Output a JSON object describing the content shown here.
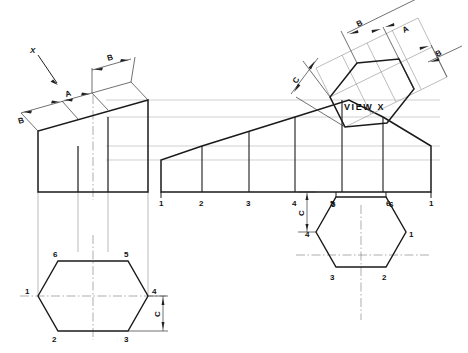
{
  "drawing": {
    "title": "Hexagonal prism — orthographic projection with auxiliary view",
    "view_label": "VIEW X",
    "direction_label": "X",
    "dimension_labels": {
      "a": "A",
      "b": "B",
      "c": "C"
    },
    "colors": {
      "object_line": "#1a1a1a",
      "thin_line": "#555555",
      "projection_line": "#b9b9b9",
      "center_line": "#8a8a8a",
      "background": "#ffffff"
    }
  },
  "left_view": {
    "name": "side-elevation-wedge",
    "top_dimensions": [
      {
        "label": "B",
        "position": "lower-left"
      },
      {
        "label": "A",
        "position": "middle"
      },
      {
        "label": "B",
        "position": "upper-right"
      }
    ],
    "direction_arrow": {
      "label": "X"
    }
  },
  "left_plan": {
    "name": "hexagon-plan-left",
    "vertex_labels": {
      "top_left": "6",
      "top_right": "5",
      "left": "1",
      "right": "4",
      "bottom_left": "2",
      "bottom_right": "3"
    },
    "dimension": {
      "label": "C"
    }
  },
  "front_view": {
    "name": "front-elevation",
    "baseline_labels": [
      "1",
      "2",
      "3",
      "4",
      "5",
      "6",
      "1"
    ],
    "dimension": {
      "label": "C"
    }
  },
  "right_plan": {
    "name": "hexagon-plan-right",
    "vertex_labels": {
      "top_left": "5",
      "top_right": "6",
      "left": "4",
      "right": "1",
      "bottom_left": "3",
      "bottom_right": "2"
    }
  },
  "auxiliary_view": {
    "name": "auxiliary-view-x",
    "label": "VIEW X",
    "dimension_labels": [
      {
        "label": "B",
        "position": "top-left"
      },
      {
        "label": "A",
        "position": "top-middle"
      },
      {
        "label": "B",
        "position": "top-right"
      },
      {
        "label": "C",
        "position": "left"
      }
    ]
  }
}
